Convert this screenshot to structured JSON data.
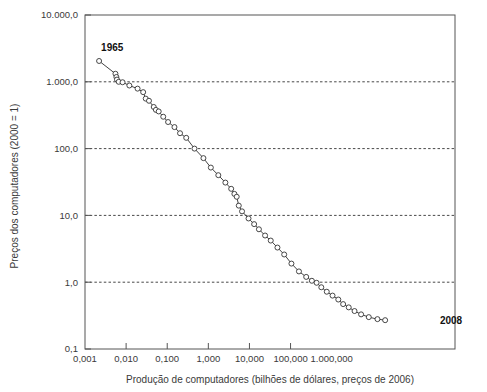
{
  "chart_data": {
    "type": "scatter",
    "title": "",
    "subtitle": "",
    "xlabel": "Produção de computadores (bilhões de dólares, preços de 2006)",
    "ylabel": "Preços dos computadores (2000 = 1)",
    "xscale": "log",
    "yscale": "log",
    "xlim": [
      0.001,
      1000000
    ],
    "ylim": [
      0.1,
      10000
    ],
    "grid": "horizontal-dashed",
    "legend": "none",
    "xticklabels": [
      "0,001",
      "0,010",
      "0,100",
      "1,000",
      "10,000",
      "100,000",
      "1.000,000"
    ],
    "xtickvalues": [
      0.001,
      0.01,
      0.1,
      1,
      10,
      100,
      1000
    ],
    "yticklabels": [
      "10.000,0",
      "1.000,0",
      "100,0",
      "10,0",
      "1,0",
      "0,1"
    ],
    "ytickvalues": [
      10000,
      1000,
      100,
      10,
      1,
      0.1
    ],
    "annotations": [
      {
        "text": "1965",
        "x": 0.0022,
        "y": 2100,
        "anchor": "above-left"
      },
      {
        "text": "2008",
        "x": 260000,
        "y": 0.27,
        "anchor": "right"
      }
    ],
    "series": [
      {
        "name": "Preços vs produção de computadores",
        "marker": "open-circle",
        "line": "solid",
        "color": "#444444",
        "points": [
          {
            "x": 0.0022,
            "y": 2050
          },
          {
            "x": 0.0055,
            "y": 1320
          },
          {
            "x": 0.0058,
            "y": 1180
          },
          {
            "x": 0.006,
            "y": 1080
          },
          {
            "x": 0.0066,
            "y": 1000
          },
          {
            "x": 0.0082,
            "y": 985
          },
          {
            "x": 0.012,
            "y": 880
          },
          {
            "x": 0.019,
            "y": 790
          },
          {
            "x": 0.026,
            "y": 700
          },
          {
            "x": 0.03,
            "y": 560
          },
          {
            "x": 0.036,
            "y": 520
          },
          {
            "x": 0.047,
            "y": 420
          },
          {
            "x": 0.053,
            "y": 380
          },
          {
            "x": 0.062,
            "y": 360
          },
          {
            "x": 0.08,
            "y": 300
          },
          {
            "x": 0.105,
            "y": 250
          },
          {
            "x": 0.15,
            "y": 210
          },
          {
            "x": 0.205,
            "y": 170
          },
          {
            "x": 0.29,
            "y": 145
          },
          {
            "x": 0.46,
            "y": 100
          },
          {
            "x": 0.76,
            "y": 72
          },
          {
            "x": 1.15,
            "y": 52
          },
          {
            "x": 1.75,
            "y": 40
          },
          {
            "x": 2.6,
            "y": 31
          },
          {
            "x": 3.6,
            "y": 25
          },
          {
            "x": 4.3,
            "y": 21
          },
          {
            "x": 4.9,
            "y": 19
          },
          {
            "x": 5.5,
            "y": 14
          },
          {
            "x": 6.6,
            "y": 11.5
          },
          {
            "x": 9.5,
            "y": 9.0
          },
          {
            "x": 13.0,
            "y": 7.4
          },
          {
            "x": 17.0,
            "y": 6.2
          },
          {
            "x": 24.0,
            "y": 5.0
          },
          {
            "x": 33.0,
            "y": 4.2
          },
          {
            "x": 48.0,
            "y": 3.3
          },
          {
            "x": 70.0,
            "y": 2.6
          },
          {
            "x": 105.0,
            "y": 1.9
          },
          {
            "x": 160.0,
            "y": 1.45
          },
          {
            "x": 240.0,
            "y": 1.2
          },
          {
            "x": 330.0,
            "y": 1.05
          },
          {
            "x": 430.0,
            "y": 0.98
          },
          {
            "x": 560.0,
            "y": 0.84
          },
          {
            "x": 760.0,
            "y": 0.72
          },
          {
            "x": 1050.0,
            "y": 0.63
          },
          {
            "x": 1450.0,
            "y": 0.55
          },
          {
            "x": 1900.0,
            "y": 0.47
          },
          {
            "x": 2600.0,
            "y": 0.42
          },
          {
            "x": 3600.0,
            "y": 0.37
          },
          {
            "x": 5200.0,
            "y": 0.33
          },
          {
            "x": 8000.0,
            "y": 0.3
          },
          {
            "x": 13000.0,
            "y": 0.28
          },
          {
            "x": 20000.0,
            "y": 0.27
          }
        ]
      }
    ]
  },
  "colors": {
    "axis": "#555555",
    "grid": "#333333",
    "line": "#444444",
    "marker_stroke": "#333333",
    "marker_fill": "#ffffff",
    "text": "#3a3a3a",
    "background": "#ffffff"
  }
}
